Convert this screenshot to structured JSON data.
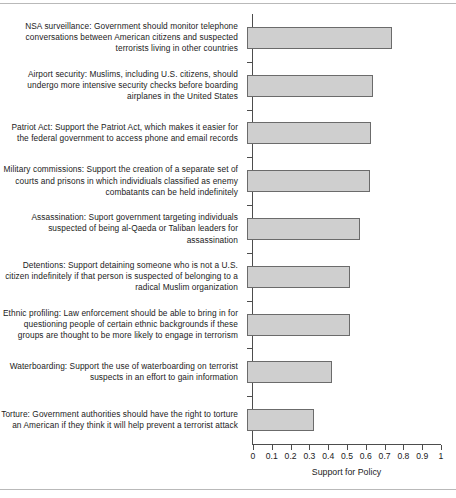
{
  "chart_data": {
    "type": "bar",
    "orientation": "horizontal",
    "title": "",
    "subtitle": "",
    "xlabel": "Support for Policy",
    "ylabel": "",
    "xlim": [
      0,
      1
    ],
    "ylim": null,
    "grid": false,
    "legend": null,
    "legend_position": "none",
    "xticks": [
      "0",
      "0.1",
      "0.2",
      "0.3",
      "0.4",
      "0.5",
      "0.6",
      "0.7",
      "0.8",
      "0.9",
      "1"
    ],
    "xtick_values": [
      0,
      0.1,
      0.2,
      0.3,
      0.4,
      0.5,
      0.6,
      0.7,
      0.8,
      0.9,
      1
    ],
    "bar_fill_color": "#cfcfcf",
    "bar_edge_color": "#6b6b6b",
    "categories": [
      "NSA surveillance: Government should monitor telephone conversations between American citizens and suspected terrorists living in other countries",
      "Airport security: Muslims, including U.S. citizens, should undergo more intensive security checks before boarding airplanes in the United States",
      "Patriot Act: Support the Patriot Act, which makes it easier for the federal government to access phone and email records",
      "Military commissions: Support the creation of a separate set of courts and prisons in which individiuals classified as enemy combatants can be held indefinitely",
      "Assassination: Suport government targeting individuals suspected of being al-Qaeda or Taliban leaders for assassination",
      "Detentions: Support detaining someone who is not a U.S. citizen indefinitely if that person is suspected of belonging to a radical Muslim organization",
      "Ethnic profiling: Law enforcement should be able to bring in for questioning people of certain ethnic backgrounds if these groups are thought to be more likely to engage in terrorism",
      "Waterboarding: Support the use of waterboarding on terrorist suspects in an effort to gain information",
      "Torture: Government authorities should have the right to torture an American if they think it will help prevent a terrorist attack"
    ],
    "values": [
      0.77,
      0.67,
      0.66,
      0.655,
      0.6,
      0.55,
      0.55,
      0.45,
      0.355
    ]
  }
}
